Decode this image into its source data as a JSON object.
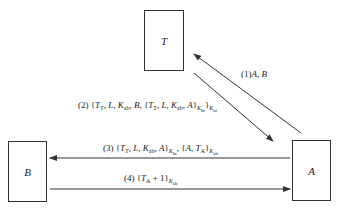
{
  "diagram": {
    "type": "protocol-message-flow",
    "nodes": [
      {
        "id": "T",
        "label": "T"
      },
      {
        "id": "B",
        "label": "B"
      },
      {
        "id": "A",
        "label": "A"
      }
    ],
    "messages": [
      {
        "step": "(1)",
        "from": "A",
        "to": "T",
        "text": "(1) A, B"
      },
      {
        "step": "(2)",
        "from": "T",
        "to": "A",
        "text": "(2) {T_T, L, K_ab, B, {T_T, L, K_ab, A}_K_bt}_K_at"
      },
      {
        "step": "(3)",
        "from": "A",
        "to": "B",
        "text": "(3) {T_T, L, K_ab, A}_K_bt, {A, T_A}_K_ab"
      },
      {
        "step": "(4)",
        "from": "B",
        "to": "A",
        "text": "(4) {T_A + 1}_K_ab"
      }
    ]
  },
  "labels": {
    "node_t": "T",
    "node_b": "B",
    "node_a": "A",
    "m1_step": "(1)",
    "m1_body": "A, B",
    "m2_step": "(2)",
    "m3_step": "(3)",
    "m4_step": "(4)"
  },
  "colors": {
    "line": "#333333",
    "background": "#ffffff"
  }
}
